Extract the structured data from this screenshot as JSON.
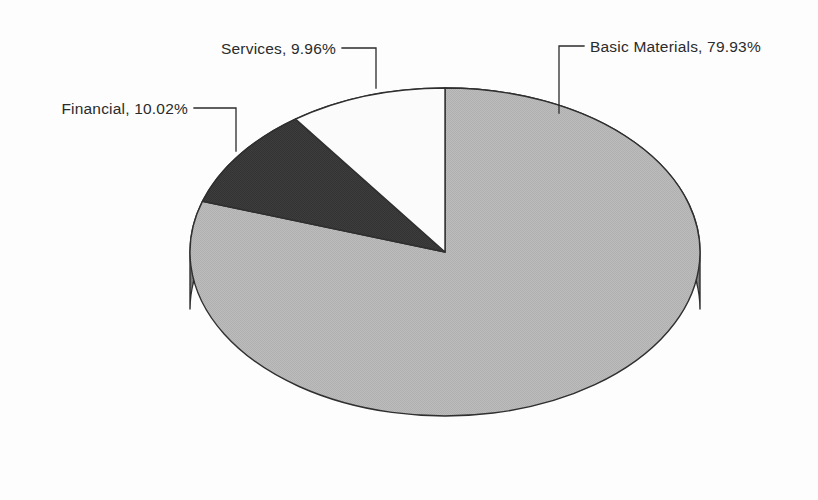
{
  "chart_data": {
    "type": "pie",
    "title": "",
    "subtitle": "",
    "xlabel": "",
    "ylabel": "",
    "three_d": true,
    "legend_position": "none",
    "grid": false,
    "label_format": "{name}, {value}%",
    "start_angle_deg": 0,
    "direction": "clockwise",
    "categories": [
      "Basic Materials",
      "Financial",
      "Services"
    ],
    "values": [
      79.93,
      10.02,
      9.96
    ],
    "slices": [
      {
        "name": "Basic Materials",
        "value": 79.93,
        "label": "Basic Materials, 79.93%",
        "color": "#b8b8b8",
        "side_color": "#808080"
      },
      {
        "name": "Financial",
        "value": 10.02,
        "label": "Financial, 10.02%",
        "color": "#3a3a3a",
        "side_color": "#2a2a2a"
      },
      {
        "name": "Services",
        "value": 9.96,
        "label": "Services, 9.96%",
        "color": "#fbfbfb",
        "side_color": "#cccccc"
      }
    ]
  },
  "labels": {
    "basic_materials": "Basic Materials, 79.93%",
    "financial": "Financial, 10.02%",
    "services": "Services, 9.96%"
  },
  "colors": {
    "background": "#fdfdfd",
    "slice_light": "#b8b8b8",
    "slice_dark": "#3a3a3a",
    "slice_white": "#fbfbfb",
    "side_wall": "#808080",
    "outline": "#2f2f2f",
    "text": "#2b2b2b"
  }
}
